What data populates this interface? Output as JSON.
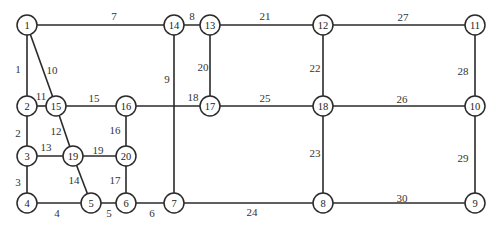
{
  "diagram": {
    "type": "network-graph",
    "nodes": [
      {
        "id": "1",
        "x": 27,
        "y": 25
      },
      {
        "id": "14",
        "x": 174,
        "y": 25
      },
      {
        "id": "13",
        "x": 210,
        "y": 25
      },
      {
        "id": "12",
        "x": 323,
        "y": 25
      },
      {
        "id": "11",
        "x": 475,
        "y": 25
      },
      {
        "id": "2",
        "x": 27,
        "y": 106
      },
      {
        "id": "15",
        "x": 56,
        "y": 106
      },
      {
        "id": "16",
        "x": 126,
        "y": 106
      },
      {
        "id": "17",
        "x": 210,
        "y": 106
      },
      {
        "id": "18",
        "x": 323,
        "y": 106
      },
      {
        "id": "10",
        "x": 475,
        "y": 106
      },
      {
        "id": "3",
        "x": 27,
        "y": 156
      },
      {
        "id": "19",
        "x": 73,
        "y": 156
      },
      {
        "id": "20",
        "x": 126,
        "y": 156
      },
      {
        "id": "4",
        "x": 27,
        "y": 203
      },
      {
        "id": "5",
        "x": 91,
        "y": 203
      },
      {
        "id": "6",
        "x": 126,
        "y": 203
      },
      {
        "id": "7",
        "x": 174,
        "y": 203
      },
      {
        "id": "8",
        "x": 323,
        "y": 203
      },
      {
        "id": "9",
        "x": 475,
        "y": 203
      }
    ],
    "edges": [
      {
        "label": "1",
        "from": "1",
        "to": "2",
        "lx": 18,
        "ly": 69
      },
      {
        "label": "2",
        "from": "2",
        "to": "3",
        "lx": 18,
        "ly": 133
      },
      {
        "label": "3",
        "from": "3",
        "to": "4",
        "lx": 18,
        "ly": 182
      },
      {
        "label": "4",
        "from": "4",
        "to": "5",
        "lx": 57,
        "ly": 213
      },
      {
        "label": "5",
        "from": "5",
        "to": "6",
        "lx": 109,
        "ly": 213
      },
      {
        "label": "6",
        "from": "6",
        "to": "7",
        "lx": 152,
        "ly": 213
      },
      {
        "label": "7",
        "from": "1",
        "to": "14",
        "lx": 114,
        "ly": 16
      },
      {
        "label": "8",
        "from": "14",
        "to": "13",
        "lx": 192,
        "ly": 16
      },
      {
        "label": "9",
        "from": "14",
        "to": "7",
        "lx": 167,
        "ly": 79
      },
      {
        "label": "10",
        "from": "1",
        "to": "15",
        "lx": 52,
        "ly": 70
      },
      {
        "label": "11",
        "from": "2",
        "to": "15",
        "lx": 41,
        "ly": 96
      },
      {
        "label": "12",
        "from": "15",
        "to": "19",
        "lx": 56,
        "ly": 131
      },
      {
        "label": "13",
        "from": "3",
        "to": "19",
        "lx": 46,
        "ly": 147
      },
      {
        "label": "14",
        "from": "19",
        "to": "5",
        "lx": 74,
        "ly": 180
      },
      {
        "label": "15",
        "from": "15",
        "to": "16",
        "lx": 94,
        "ly": 98
      },
      {
        "label": "16",
        "from": "16",
        "to": "20",
        "lx": 115,
        "ly": 130
      },
      {
        "label": "17",
        "from": "20",
        "to": "6",
        "lx": 115,
        "ly": 180
      },
      {
        "label": "18",
        "from": "16",
        "to": "17",
        "lx": 193,
        "ly": 97
      },
      {
        "label": "19",
        "from": "19",
        "to": "20",
        "lx": 98,
        "ly": 150
      },
      {
        "label": "20",
        "from": "13",
        "to": "17",
        "lx": 203,
        "ly": 67
      },
      {
        "label": "21",
        "from": "13",
        "to": "12",
        "lx": 265,
        "ly": 16
      },
      {
        "label": "22",
        "from": "12",
        "to": "18",
        "lx": 315,
        "ly": 68
      },
      {
        "label": "23",
        "from": "18",
        "to": "8",
        "lx": 315,
        "ly": 153
      },
      {
        "label": "24",
        "from": "7",
        "to": "8",
        "lx": 252,
        "ly": 212
      },
      {
        "label": "25",
        "from": "17",
        "to": "18",
        "lx": 265,
        "ly": 98
      },
      {
        "label": "26",
        "from": "18",
        "to": "10",
        "lx": 402,
        "ly": 99
      },
      {
        "label": "27",
        "from": "12",
        "to": "11",
        "lx": 403,
        "ly": 17
      },
      {
        "label": "28",
        "from": "11",
        "to": "10",
        "lx": 463,
        "ly": 71
      },
      {
        "label": "29",
        "from": "10",
        "to": "9",
        "lx": 463,
        "ly": 158
      },
      {
        "label": "30",
        "from": "8",
        "to": "9",
        "lx": 402,
        "ly": 198
      }
    ],
    "colors": {
      "stroke": "#2a2a2a",
      "background": "#ffffff",
      "text": "#222222"
    }
  }
}
